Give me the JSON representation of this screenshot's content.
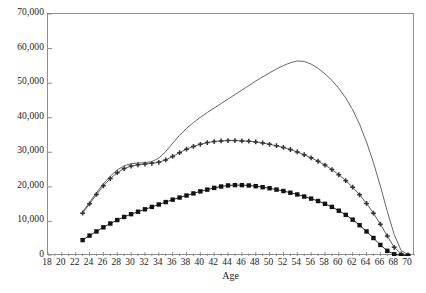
{
  "chart_data": {
    "type": "line",
    "title": "",
    "subtitle": "",
    "xlabel": "Age",
    "ylabel": "",
    "xlim": [
      18,
      71
    ],
    "ylim": [
      0,
      70000
    ],
    "grid": false,
    "legend": "none",
    "background_color": "#ffffff",
    "frame_color": "#8d8d8d",
    "x_tick_labels": [
      "18",
      "20",
      "22",
      "24",
      "26",
      "28",
      "30",
      "32",
      "34",
      "36",
      "38",
      "40",
      "42",
      "44",
      "46",
      "48",
      "50",
      "52",
      "54",
      "56",
      "58",
      "60",
      "62",
      "64",
      "66",
      "68",
      "70"
    ],
    "x_tick_values": [
      18,
      20,
      22,
      24,
      26,
      28,
      30,
      32,
      34,
      36,
      38,
      40,
      42,
      44,
      46,
      48,
      50,
      52,
      54,
      56,
      58,
      60,
      62,
      64,
      66,
      68,
      70
    ],
    "x_minor_tick_step": 1,
    "y_tick_labels": [
      "0",
      "10,000",
      "20,000",
      "30,000",
      "40,000",
      "50,000",
      "60,000",
      "70,000"
    ],
    "y_tick_values": [
      0,
      10000,
      20000,
      30000,
      40000,
      50000,
      60000,
      70000
    ],
    "x": [
      23,
      24,
      25,
      26,
      27,
      28,
      29,
      30,
      31,
      32,
      33,
      34,
      35,
      36,
      37,
      38,
      39,
      40,
      41,
      42,
      43,
      44,
      45,
      46,
      47,
      48,
      49,
      50,
      51,
      52,
      53,
      54,
      55,
      56,
      57,
      58,
      59,
      60,
      61,
      62,
      63,
      64,
      65,
      66,
      67,
      68,
      69,
      70
    ],
    "series": [
      {
        "name": "series-upper",
        "marker": "none",
        "color": "#555555",
        "line_width": 0.9,
        "values": [
          12800,
          15500,
          18300,
          20900,
          23100,
          24900,
          26100,
          26700,
          26900,
          27000,
          27300,
          28300,
          30200,
          32600,
          34900,
          36900,
          38600,
          40100,
          41500,
          42800,
          44100,
          45400,
          46700,
          48000,
          49300,
          50600,
          51800,
          53000,
          54100,
          55100,
          55900,
          56400,
          56300,
          55500,
          54300,
          52700,
          50800,
          48500,
          45700,
          42300,
          38100,
          33000,
          27000,
          20200,
          12900,
          6200,
          1600,
          400
        ]
      },
      {
        "name": "series-middle",
        "marker": "cross",
        "color": "#333333",
        "line_width": 0.8,
        "values": [
          12400,
          15100,
          17800,
          20300,
          22400,
          24100,
          25300,
          26000,
          26400,
          26600,
          26800,
          27100,
          27800,
          28800,
          29900,
          30900,
          31700,
          32300,
          32800,
          33100,
          33300,
          33400,
          33400,
          33300,
          33200,
          33000,
          32700,
          32300,
          31900,
          31400,
          30800,
          30100,
          29300,
          28400,
          27400,
          26300,
          25000,
          23500,
          21800,
          19900,
          17700,
          15200,
          12400,
          9200,
          5800,
          2500,
          600,
          200
        ]
      },
      {
        "name": "series-lower",
        "marker": "square",
        "color": "#111111",
        "line_width": 0.9,
        "values": [
          4600,
          5900,
          7100,
          8300,
          9400,
          10400,
          11300,
          12100,
          12800,
          13500,
          14200,
          14900,
          15600,
          16300,
          16900,
          17500,
          18100,
          18700,
          19200,
          19700,
          20100,
          20400,
          20500,
          20500,
          20400,
          20200,
          19900,
          19600,
          19200,
          18800,
          18300,
          17800,
          17200,
          16600,
          15900,
          15100,
          14200,
          13100,
          11900,
          10500,
          8900,
          7100,
          5200,
          3200,
          1500,
          500,
          150,
          100
        ]
      }
    ]
  },
  "axes": {
    "x_title": "Age"
  },
  "caption": {
    "cropped_footnote": ""
  }
}
